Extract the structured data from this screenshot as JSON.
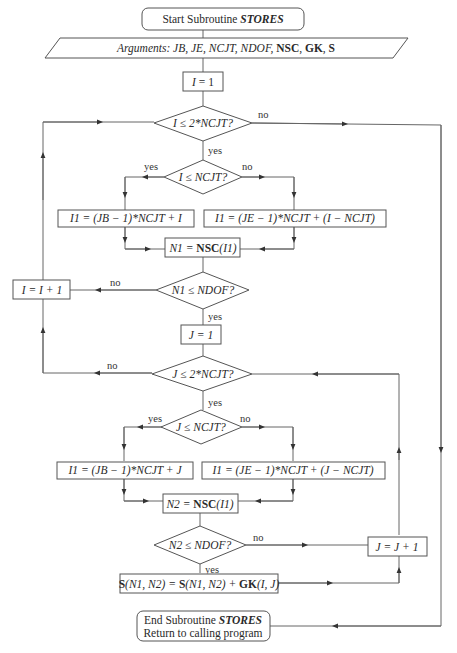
{
  "diagram": {
    "type": "flowchart",
    "title": "Subroutine STORES",
    "nodes": {
      "start": {
        "pre": "Start Subroutine ",
        "name": "STORES"
      },
      "args": {
        "prefix": "Arguments: ",
        "italic_args": "JB, JE, NCJT, NDOF, ",
        "bold_args": [
          "NSC",
          "GK",
          "S"
        ]
      },
      "init_i": {
        "lhs": "I",
        "op": " = ",
        "rhs": "1"
      },
      "cond_i_outer": {
        "text": "I ≤ 2*NCJT?"
      },
      "cond_i_inner": {
        "text": "I ≤ NCJT?"
      },
      "i1_left": {
        "text": "I1 = (JB − 1)*NCJT + I"
      },
      "i1_right": {
        "text": "I1 = (JE − 1)*NCJT + (I − NCJT)"
      },
      "n1_assign": {
        "lhs": "N1 = ",
        "func": "NSC",
        "arg": "(I1)"
      },
      "cond_n1": {
        "text": "N1 ≤ NDOF?"
      },
      "incr_i": {
        "text": "I = I + 1"
      },
      "init_j": {
        "text": "J = 1"
      },
      "cond_j_outer": {
        "text": "J ≤ 2*NCJT?"
      },
      "cond_j_inner": {
        "text": "J ≤ NCJT?"
      },
      "i1_left_j": {
        "text": "I1 = (JB − 1)*NCJT + J"
      },
      "i1_right_j": {
        "text": "I1 = (JE − 1)*NCJT + (J − NCJT)"
      },
      "n2_assign": {
        "lhs": "N2 = ",
        "func": "NSC",
        "arg": "(I1)"
      },
      "cond_n2": {
        "text": "N2 ≤ NDOF?"
      },
      "incr_j": {
        "text": "J = J + 1"
      },
      "accumulate": {
        "s1": "S",
        "a1": "(N1, N2) = ",
        "s2": "S",
        "a2": "(N1, N2) + ",
        "gk": "GK",
        "a3": "(I, J)"
      },
      "end": {
        "line1_pre": "End Subroutine ",
        "line1_name": "STORES",
        "line2": "Return to calling program"
      }
    },
    "edge_labels": {
      "yes": "yes",
      "no": "no"
    }
  }
}
